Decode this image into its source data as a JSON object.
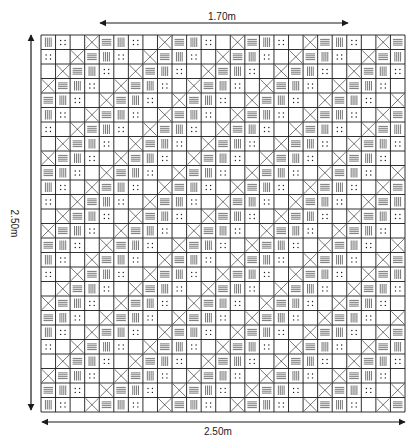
{
  "diagram": {
    "colors": {
      "line": "#1a1a1a",
      "background": "#ffffff"
    },
    "dimensions": {
      "top": {
        "label": "1.70m",
        "x1": 100,
        "x2": 348,
        "y": 23
      },
      "left": {
        "label": "2.50m",
        "x": 31,
        "y1": 35,
        "y2": 410
      },
      "bottom": {
        "label": "2.50m",
        "x1": 42,
        "x2": 405,
        "y": 422
      }
    },
    "grid": {
      "x": 41,
      "y": 35,
      "width": 364,
      "height": 377,
      "cols": 25,
      "rows": 26,
      "symbol_legend": {
        "V": "vertical-lines",
        "H": "horizontal-lines",
        "D": "four-dots",
        "X": "cross",
        "B": "blank"
      },
      "cycle": [
        "V",
        "D",
        "B",
        "X",
        "H"
      ],
      "row_shift": 1
    }
  }
}
